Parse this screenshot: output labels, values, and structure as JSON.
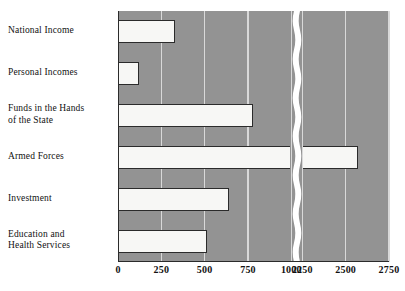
{
  "chart_data": {
    "type": "bar",
    "orientation": "horizontal",
    "title": "",
    "xlabel": "",
    "ylabel": "",
    "categories": [
      "National Income",
      "Personal Incomes",
      "Funds in the Hands\nof the State",
      "Armed Forces",
      "Investment",
      "Education and\nHealth Services"
    ],
    "values": [
      330,
      120,
      780,
      2570,
      640,
      515
    ],
    "xticks": [
      0,
      250,
      500,
      750,
      1000,
      2250,
      2500,
      2750
    ],
    "xtick_labels": [
      "0",
      "250",
      "500",
      "750",
      "1000",
      "2250",
      "2500",
      "2750"
    ],
    "axis_break": {
      "from": 1000,
      "to": 2250
    },
    "xlim": [
      0,
      2750
    ],
    "grid": true,
    "legend": "none",
    "colors": {
      "plot_background": "#939393",
      "gridline": "#d9d9d9",
      "bar_fill": "#f7f7f5",
      "bar_outline": "#2b2b2b",
      "page_background": "#ffffff",
      "text": "#111111"
    }
  }
}
